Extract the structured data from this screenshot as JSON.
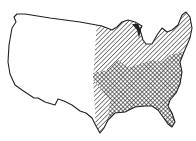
{
  "figure": {
    "top_text_fragment": "· · ·  ·",
    "legend": [],
    "regions": [
      {
        "name": "unshaded-west",
        "pattern": "none"
      },
      {
        "name": "hatched-range",
        "pattern": "diagonal-lines",
        "area": "eastern United States"
      },
      {
        "name": "cross-hatched-range",
        "pattern": "cross-hatch",
        "area": "southeastern United States"
      }
    ],
    "colors": {
      "ink": "#222222",
      "paper": "#ffffff"
    }
  }
}
